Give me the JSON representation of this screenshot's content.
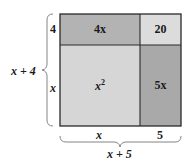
{
  "diagram": {
    "type": "area-model",
    "cells": [
      {
        "id": "top-left",
        "text": "4x",
        "color": "#b3b3b3"
      },
      {
        "id": "top-right",
        "text": "20",
        "color": "#dcdcdc"
      },
      {
        "id": "bottom-left",
        "text": "x",
        "sup": "2",
        "color": "#d6d6d6"
      },
      {
        "id": "bottom-right",
        "text": "5x",
        "color": "#a9a9a9"
      }
    ],
    "left_labels": {
      "top": "4",
      "bottom": "x",
      "brace": "x + 4"
    },
    "bottom_labels": {
      "left": "x",
      "right": "5",
      "brace": "x + 5"
    },
    "border_color": "#2a2a2a"
  }
}
